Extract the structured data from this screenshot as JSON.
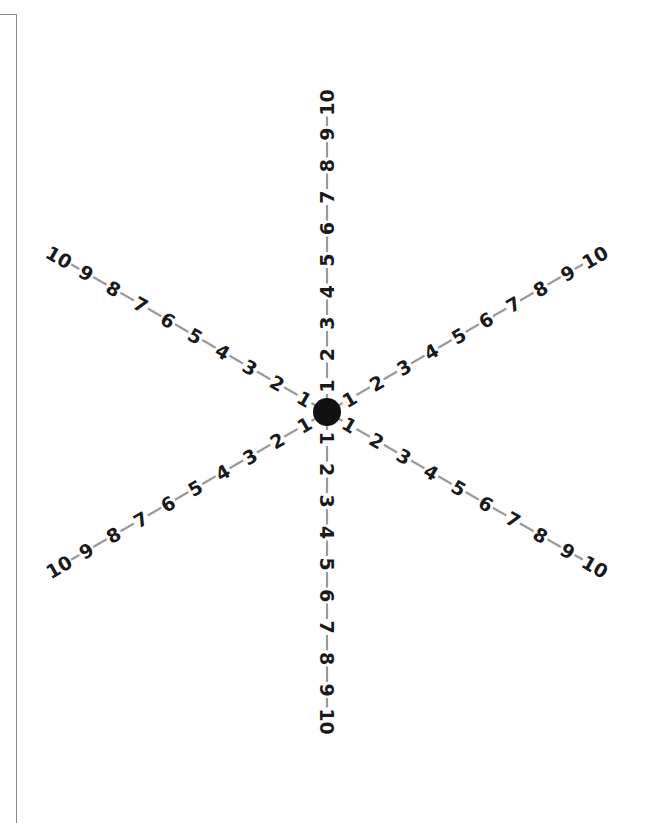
{
  "figure": {
    "type": "radial-number-star",
    "center": {
      "x": 327,
      "y": 412
    },
    "center_dot_radius": 14,
    "colors": {
      "text": "#1a1a1a",
      "connector": "#9a9a9a",
      "dot": "#111111",
      "border": "#8a8a8a",
      "background": "#ffffff"
    },
    "step_spacing": 31.5,
    "first_offset": 26,
    "arms": [
      {
        "name": "up",
        "angle_deg": -90,
        "labels": [
          "1",
          "2",
          "3",
          "4",
          "5",
          "6",
          "7",
          "8",
          "9",
          "10"
        ]
      },
      {
        "name": "down",
        "angle_deg": 90,
        "labels": [
          "1",
          "2",
          "3",
          "4",
          "5",
          "6",
          "7",
          "8",
          "9",
          "10"
        ]
      },
      {
        "name": "upper-right",
        "angle_deg": -30,
        "labels": [
          "1",
          "2",
          "3",
          "4",
          "5",
          "6",
          "7",
          "8",
          "9",
          "10"
        ]
      },
      {
        "name": "lower-right",
        "angle_deg": 30,
        "labels": [
          "1",
          "2",
          "3",
          "4",
          "5",
          "6",
          "7",
          "8",
          "9",
          "10"
        ]
      },
      {
        "name": "upper-left",
        "angle_deg": -150,
        "labels": [
          "1",
          "2",
          "3",
          "4",
          "5",
          "6",
          "7",
          "8",
          "9",
          "10"
        ]
      },
      {
        "name": "lower-left",
        "angle_deg": 150,
        "labels": [
          "1",
          "2",
          "3",
          "4",
          "5",
          "6",
          "7",
          "8",
          "9",
          "10"
        ]
      }
    ]
  }
}
